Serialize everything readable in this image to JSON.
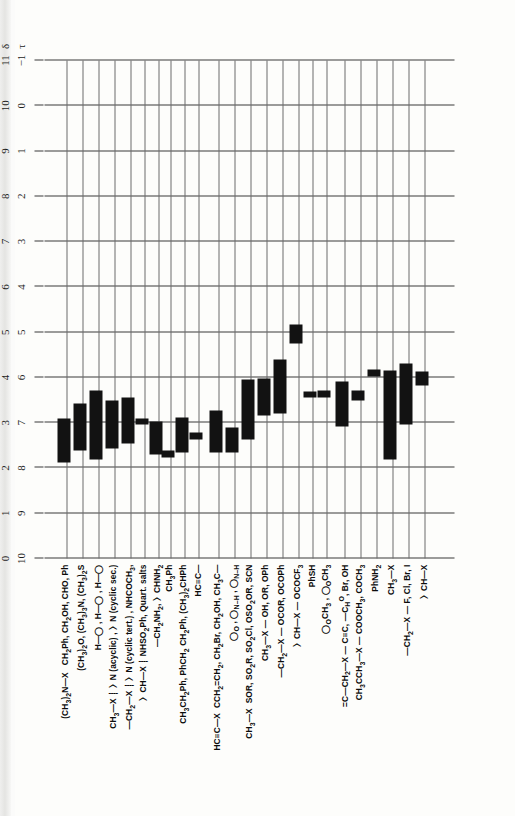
{
  "figure": {
    "kind": "nmr-proton-chemical-shift-correlation-chart",
    "orientation": "rotated-90-ccw",
    "axes": {
      "tau": {
        "symbol": "τ",
        "ticks": [
          "10",
          "9",
          "8",
          "7",
          "6",
          "5",
          "4",
          "3",
          "2",
          "1",
          "0",
          "−1"
        ]
      },
      "delta": {
        "symbol": "δ",
        "ticks": [
          "0",
          "1",
          "2",
          "3",
          "4",
          "5",
          "6",
          "7",
          "8",
          "9",
          "10",
          "11"
        ]
      }
    }
  },
  "chart_data": {
    "type": "bar",
    "title": "",
    "xlabel": "τ / δ (ppm)",
    "ylabel": "",
    "grid": true,
    "xlim_tau": [
      10,
      -1
    ],
    "xlim_delta": [
      0,
      11
    ],
    "legend": "none",
    "note": "Horizontal floating bars: each row is a proton environment; bar spans its chemical-shift range in δ (ppm).",
    "categories": [
      "(CH3)2N—X   CH2Ph, CH2OH, CHO, Ph",
      "(CH3)2O, (CH3)3N, (CH3)2S",
      "H—(bicyclic), H—(bicyclic), H—(bicyclic)",
      "CH3—X  —〉N (acyclic), 〉N (cyclic sec.)",
      "—CH2—X  〉N (cyclic tert.), NHCOCH3,",
      "〉CH—X   NHSO2Ph, Quart. salts",
      "—CH2NH2,  〉CHNH2",
      "CH3Ph",
      "CH3CH2Ph, PhCH2 CH2Ph, (CH3)2CHPh",
      "HC≡C—",
      "HC≡C—X   CCH2=CH2, CH2Br, CH2OH, CH3C(=O)—",
      "cyclic acetal / lactam ring protons",
      "CH3—X   SOR, SO2R, SO2Cl, OSO2OR, SCN",
      "CH3—X — OH, OR, OPh",
      "—CH2—X — OCOR, OCOPh",
      "〉CH—X — OCOCF3",
      "PhSH",
      "OCH3 (furan/pyran ring), OCH2",
      "=C—CH2—X — C≡C, —CHO, Br, OH",
      "CH3CCH3—X — COOCH3, COCH3",
      "PhNH2",
      "CH3—X",
      "—CH2—X  — F, Cl, Br, I",
      "〉CH—X"
    ],
    "bars_delta": [
      {
        "row": 0,
        "start": 2.12,
        "end": 3.1
      },
      {
        "row": 1,
        "start": 2.38,
        "end": 3.42
      },
      {
        "row": 2,
        "start": 2.18,
        "end": 3.7
      },
      {
        "row": 3,
        "start": 2.42,
        "end": 3.5
      },
      {
        "row": 4,
        "start": 2.55,
        "end": 3.55
      },
      {
        "row": 5,
        "start": 2.95,
        "end": 3.1
      },
      {
        "row": 6,
        "start": 2.3,
        "end": 3.02
      },
      {
        "row": 7,
        "start": 2.22,
        "end": 2.38
      },
      {
        "row": 8,
        "start": 2.35,
        "end": 3.12
      },
      {
        "row": 9,
        "start": 2.62,
        "end": 2.78
      },
      {
        "row": 10,
        "start": 2.35,
        "end": 3.28
      },
      {
        "row": 11,
        "start": 2.35,
        "end": 2.9
      },
      {
        "row": 12,
        "start": 2.62,
        "end": 3.95
      },
      {
        "row": 13,
        "start": 3.15,
        "end": 3.98
      },
      {
        "row": 14,
        "start": 3.2,
        "end": 4.4
      },
      {
        "row": 15,
        "start": 4.75,
        "end": 5.18
      },
      {
        "row": 16,
        "start": 3.55,
        "end": 3.68
      },
      {
        "row": 17,
        "start": 3.55,
        "end": 3.72
      },
      {
        "row": 18,
        "start": 2.92,
        "end": 3.92
      },
      {
        "row": 19,
        "start": 3.48,
        "end": 3.7
      },
      {
        "row": 20,
        "start": 4.02,
        "end": 4.18
      },
      {
        "row": 21,
        "start": 2.18,
        "end": 4.15
      },
      {
        "row": 22,
        "start": 2.95,
        "end": 4.3
      },
      {
        "row": 23,
        "start": 3.82,
        "end": 4.12
      }
    ]
  },
  "rows": [
    {
      "id": "row-me2n-x",
      "html": "<b>(CH<span class='sub'>3</span>)<span class='sub'>2</span>N—X</b> &nbsp;&nbsp;<b>CH<span class='sub'>2</span>Ph, CH<span class='sub'>2</span>OH, CHO, Ph</b>"
    },
    {
      "id": "row-me2o",
      "html": "<b>(CH<span class='sub'>3</span>)<span class='sub'>2</span>O, (CH<span class='sub'>3</span>)<span class='sub'>3</span>N, (CH<span class='sub'>3</span>)<span class='sub'>2</span>S</b>"
    },
    {
      "id": "row-bicyclic-h",
      "html": "<b>H</b>—◯ , <b>H</b>—◯ , <b>H</b>—◯"
    },
    {
      "id": "row-ch3-x-n",
      "html": "<b>CH<span class='sub'>3</span>—X</b>&nbsp;〉N (acyclic) , 〉N (cyclic sec.)"
    },
    {
      "id": "row-ch2-x-n",
      "html": "—<b>CH<span class='sub'>2</span>—X</b>&nbsp;〉N (cyclic tert.) , NHCOCH<span class='sub'>3</span>,"
    },
    {
      "id": "row-ch-x-n",
      "html": "〉<b>CH—X</b>&nbsp;NHSO<span class='sub'>2</span>Ph, Quart. salts"
    },
    {
      "id": "row-ch2nh2",
      "html": "—<b>CH<span class='sub'>2</span>NH<span class='sub'>2</span></b>, 〉<b>CHNH<span class='sub'>2</span></b>"
    },
    {
      "id": "row-ch3ph",
      "html": "<b>CH<span class='sub'>3</span>Ph</b>"
    },
    {
      "id": "row-ch3ch2ph",
      "html": "<b>CH<span class='sub'>3</span>CH<span class='sub'>2</span>Ph, PhCH<span class='sub'>2</span> CH<span class='sub'>2</span>Ph, (CH<span class='sub'>3</span>)<span class='sub'>2</span>CHPh</b>"
    },
    {
      "id": "row-alkyne",
      "html": "<b>HC≡C—</b>"
    },
    {
      "id": "row-alkyne-x",
      "html": "<b>HC≡C—X</b>&nbsp;&nbsp;<b>CCH<span class='sub'>2</span>=CH<span class='sub'>2</span>, CH<span class='sub'>2</span>Br, CH<span class='sub'>2</span>OH, CH<span class='sub'>3</span>C—</b>"
    },
    {
      "id": "row-ring-acetal",
      "html": "cyclic acetal / N-H lactam ring protons"
    },
    {
      "id": "row-ch3-x-sor",
      "html": "<b>CH<span class='sub'>3</span>—X</b>&nbsp;&nbsp;<b>SOR, SO<span class='sub'>2</span>R, SO<span class='sub'>2</span>Cl, OSO<span class='sub'>2</span>OR, SCN</b>"
    },
    {
      "id": "row-ch3-x-oh",
      "html": "<b>CH<span class='sub'>3</span>—X</b>&nbsp;— <b>OH, OR, OPh</b>"
    },
    {
      "id": "row-ch2-x-ocor",
      "html": "—<b>CH<span class='sub'>2</span>—X</b>&nbsp;— <b>OCOR, OCOPh</b>"
    },
    {
      "id": "row-ch-x-ococf3",
      "html": "〉<b>CH—X</b>&nbsp;— <b>OCOCF<span class='sub'>3</span></b>"
    },
    {
      "id": "row-phsh",
      "html": "<b>PhSH</b>"
    },
    {
      "id": "row-och",
      "html": "◯<b>CH<span class='sub'>3</span></b> , ◯<b>CH<span class='sub'>3</span></b> , ◯<b>CH<span class='sub'>3</span></b>"
    },
    {
      "id": "row-vinyl-ch2x",
      "html": "=<b>C—CH<span class='sub'>2</span>—X</b>&nbsp;— <b>C≡C, —CHO, Br, OH</b>"
    },
    {
      "id": "row-ch3cch3",
      "html": "<b>CH<span class='sub'>3</span>CCH<span class='sub'>3</span>—X</b>&nbsp;— <b>COOCH<span class='sub'>3</span>, COCH<span class='sub'>3</span></b>"
    },
    {
      "id": "row-phnh2",
      "html": "<b>PhNH<span class='sub'>2</span></b>"
    },
    {
      "id": "row-ch3-x-hal",
      "html": "<b>CH<span class='sub'>3</span>—X</b>"
    },
    {
      "id": "row-ch2-x-hal",
      "html": "—<b>CH<span class='sub'>2</span>—X</b>&nbsp;— <b>F, Cl, Br, I</b>"
    },
    {
      "id": "row-ch-x-hal",
      "html": "〉<b>CH—X</b>"
    }
  ],
  "label_groups": [
    {
      "text": "(CH₃)₂N—X    CH₂Ph, CH₂OH, CHO, Ph"
    },
    {
      "text": "(CH₃)₂O, (CH₃)₃N, (CH₃)₂S"
    },
    {
      "text": "H— , H— , H—"
    },
    {
      "text": "CH₃—X   〉N (acyclic) , 〉N (cyclic sec.)"
    },
    {
      "text": "—CH₂—X   〉N (cyclic tert.) , NHCOCH₃,"
    },
    {
      "text": "〉CH—X    NHSO₂Ph, Quart. salts"
    },
    {
      "text": "—CH₂NH₂,  〉CHNH₂"
    },
    {
      "text": "CH₃Ph"
    },
    {
      "text": "CH₃CH₂Ph, PhCH₂ CH₂Ph, (CH₃)₂CHPh"
    },
    {
      "text": "HC≡C—"
    },
    {
      "text": "HC≡C—X   CCH₂=CH₂, CH₂Br, CH₂OH, CH₃C—"
    },
    {
      "text": "O═"
    },
    {
      "text": "CH₃—X   SOR, SO₂R, SO₂Cl, OSO₂OR, SCN"
    },
    {
      "text": "CH₃—X — OH, OR, OPh"
    },
    {
      "text": "—CH₂—X — OCOR, OCOPh"
    },
    {
      "text": "〉CH—X — OCOCF₃"
    },
    {
      "text": "PhSH"
    },
    {
      "text": "OCH₃ ,  OCH₃"
    },
    {
      "text": "=C—CH₂—X — C≡C, —CHO, Br, OH"
    },
    {
      "text": "CH₃CCH₃—X — COOCH₃, COCH₃"
    },
    {
      "text": "PhNH₂"
    },
    {
      "text": "CH₃—X"
    },
    {
      "text": "—CH₂—X — F, Cl, Br, I"
    },
    {
      "text": "〉CH—X"
    }
  ]
}
